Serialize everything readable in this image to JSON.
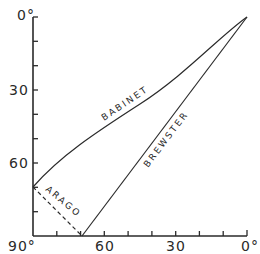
{
  "diagram": {
    "y_axis": {
      "tick_labels": [
        {
          "text": "0°",
          "value": 0
        },
        {
          "text": "30",
          "value": 30
        },
        {
          "text": "60",
          "value": 60
        },
        {
          "text": "90°",
          "value": 90
        }
      ],
      "minor_tick_step": 10,
      "direction": "top-to-bottom"
    },
    "x_axis": {
      "tick_labels": [
        {
          "text": "90°",
          "value": 90
        },
        {
          "text": "60",
          "value": 60
        },
        {
          "text": "30",
          "value": 30
        },
        {
          "text": "0°",
          "value": 0
        }
      ],
      "minor_tick_step": 10,
      "direction": "left-to-right-decreasing"
    },
    "curves": [
      {
        "name": "babinet",
        "label": "BABINET",
        "style": "solid",
        "from": [
          0,
          0
        ],
        "to": [
          90,
          70
        ],
        "shape": "slightly concave curve"
      },
      {
        "name": "brewster",
        "label": "BREWSTER",
        "style": "solid",
        "from": [
          0,
          0
        ],
        "to": [
          69,
          90
        ],
        "shape": "straight line"
      },
      {
        "name": "arago",
        "label": "ARAGO",
        "style": "dashed",
        "from": [
          90,
          70
        ],
        "to": [
          69,
          90
        ],
        "shape": "straight line"
      }
    ]
  }
}
